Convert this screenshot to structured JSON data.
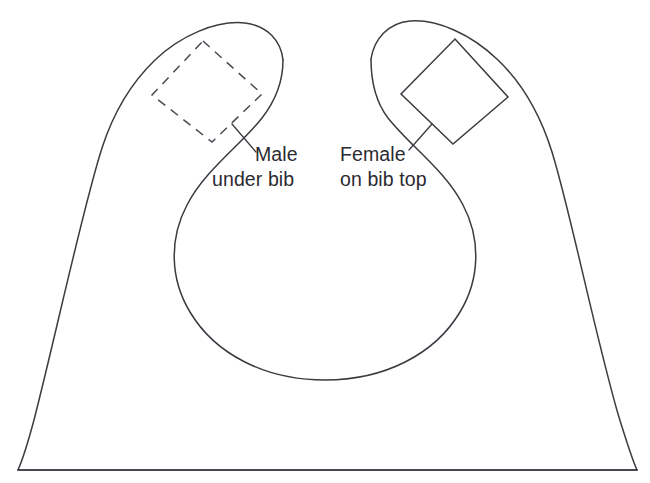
{
  "diagram": {
    "background_color": "#ffffff",
    "line_color": "#3b3b42",
    "text_color": "#2b2b31",
    "canvas": {
      "width": 650,
      "height": 483
    }
  },
  "annotations": [
    {
      "id": "male",
      "line1": "Male",
      "line2": "under bib",
      "patch_style": "dashed",
      "side": "left"
    },
    {
      "id": "female",
      "line1": "Female",
      "line2": "on bib top",
      "patch_style": "solid",
      "side": "right"
    }
  ],
  "shapes": {
    "bib_outline_name": "bib-body-outline",
    "neck_opening_name": "neck-opening",
    "hem_name": "bottom-hem-line",
    "left_patch_name": "male-snap-patch",
    "right_patch_name": "female-snap-patch"
  }
}
